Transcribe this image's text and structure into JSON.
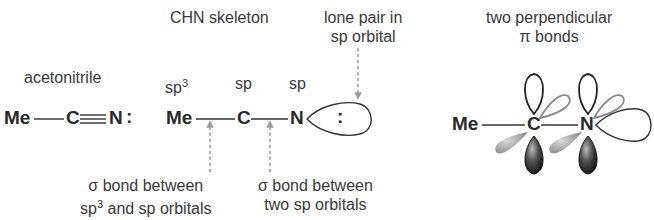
{
  "diagram": {
    "panel_left": {
      "label": "acetonitrile",
      "formula": {
        "me": "Me",
        "c": "C",
        "n": "N",
        "lone_pair": ":"
      }
    },
    "panel_middle": {
      "top_label_line1": "CHN skeleton",
      "hybridization": {
        "me": "sp",
        "me_sup": "3",
        "c": "sp",
        "n": "sp"
      },
      "atoms": {
        "me": "Me",
        "c": "C",
        "n": "N",
        "lone_pair": ":"
      },
      "lone_pair_label": {
        "line1": "lone pair in",
        "line2": "sp orbital"
      },
      "sigma1_label": {
        "line1": "σ bond between",
        "line2_pre": "sp",
        "line2_sup": "3",
        "line2_post": " and sp orbitals"
      },
      "sigma2_label": {
        "line1": "σ bond between",
        "line2": "two sp orbitals"
      }
    },
    "panel_right": {
      "label": {
        "line1": "two perpendicular",
        "line2": "π bonds"
      },
      "atoms": {
        "me": "Me",
        "c": "C",
        "n": "N",
        "lone_pair": ":"
      }
    },
    "colors": {
      "text": "#333333",
      "arrow": "#999999",
      "lobe_dark": "#222222",
      "lobe_grey": "#9a9a9a"
    }
  }
}
